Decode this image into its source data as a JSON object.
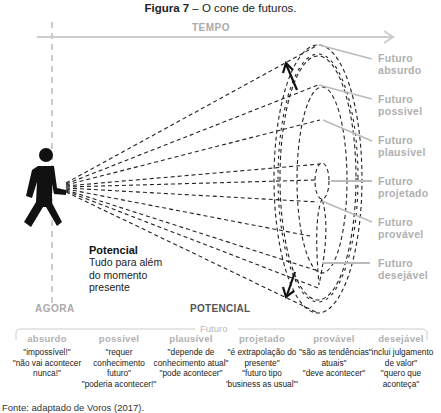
{
  "figure": {
    "title_bold": "Figura 7",
    "title_rest": " – O cone de futuros."
  },
  "axis": {
    "time_label": "TEMPO",
    "now_label": "AGORA",
    "potential_label": "POTENCIAL"
  },
  "potential_note": {
    "title": "Potencial",
    "line1": "Tudo para além",
    "line2": "do momento",
    "line3": "presente"
  },
  "cone_labels": [
    {
      "line1": "Futuro",
      "line2": "absurdo"
    },
    {
      "line1": "Futuro",
      "line2": "possível"
    },
    {
      "line1": "Futuro",
      "line2": "plausível"
    },
    {
      "line1": "Futuro",
      "line2": "projetado"
    },
    {
      "line1": "Futuro",
      "line2": "provável"
    },
    {
      "line1": "Futuro",
      "line2": "desejável"
    }
  ],
  "bracket": {
    "label": "Futuro"
  },
  "columns": [
    {
      "head": "absurdo",
      "quotes": "\"impossível!\"\n\"não vai acontecer\nnunca!\""
    },
    {
      "head": "possível",
      "quotes": "\"requer\nconhecimento\nfuturo\"\n\"poderia acontecer!\""
    },
    {
      "head": "plausível",
      "quotes": "\"depende de\nconhecimento atual\"\n\"pode acontecer\""
    },
    {
      "head": "projetado",
      "quotes": "\"é extrapolação do\npresente\"\n\"futuro tipo\n'business as usual'\""
    },
    {
      "head": "provável",
      "quotes": "\"são as tendências\natuais\"\n\"deve acontecer\""
    },
    {
      "head": "desejável",
      "quotes": "\"inclui julgamento\nde valor\"\n\"quero que\naconteça\""
    }
  ],
  "source": {
    "text": "Fonte: adaptado de Voros (2017)."
  },
  "colors": {
    "label_gray": "#b0b0b0",
    "axis_gray": "#cccccc",
    "line_dark": "#222222"
  }
}
